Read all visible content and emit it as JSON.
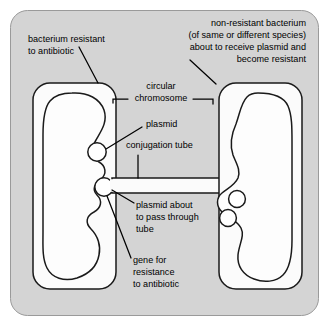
{
  "figure": {
    "background_color": "#ffffff",
    "panel_color": "#d4d4d4",
    "cell_fill_color": "#fbfbfb",
    "line_color": "#1a1a1a"
  },
  "labels": {
    "left_cell": {
      "lines": [
        "bacterium resistant",
        "to antibiotic"
      ]
    },
    "right_cell": {
      "lines": [
        "non-resistant bacterium",
        "(of same or different species)",
        "about to receive plasmid and",
        "become resistant"
      ]
    },
    "chromosome": {
      "lines": [
        "circular",
        "chromosome"
      ]
    },
    "plasmid": {
      "lines": [
        "plasmid"
      ]
    },
    "conjugation_tube": {
      "lines": [
        "conjugation tube"
      ]
    },
    "plasmid_passing": {
      "lines": [
        "plasmid about",
        "to pass through",
        "tube"
      ]
    },
    "resistance_gene": {
      "lines": [
        "gene for",
        "resistance",
        "to antibiotic"
      ]
    }
  }
}
